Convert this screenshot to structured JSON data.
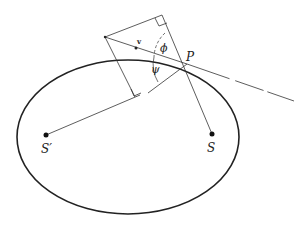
{
  "diagram": {
    "type": "ellipse-geometry",
    "labels": {
      "focus_left": "S′",
      "focus_right": "S",
      "point": "P",
      "angle_upper": "ϕ",
      "angle_lower": "ψ",
      "vector": "v"
    },
    "colors": {
      "stroke": "#222222",
      "background": "#ffffff"
    }
  }
}
